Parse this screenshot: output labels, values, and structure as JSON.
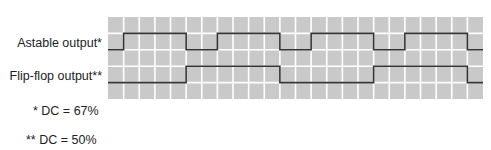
{
  "labels": {
    "astable": "Astable output*",
    "flipflop": "Flip-flop output**"
  },
  "notes": {
    "astable_dc": "* DC = 67%",
    "flipflop_dc": "** DC = 50%"
  },
  "grid": {
    "columns": 24,
    "rows": 5,
    "cell_fill": "#c9c9c9",
    "line_color": "#ffffff",
    "trace_color": "#333333"
  },
  "waveforms": {
    "astable": {
      "duty_cycle_percent": 67,
      "transitions_at_cell": [
        1,
        5,
        7,
        11,
        13,
        17,
        19,
        23
      ],
      "initial_level": "low"
    },
    "flipflop": {
      "duty_cycle_percent": 50,
      "transitions_at_cell": [
        5,
        11,
        17,
        23
      ],
      "initial_level": "low"
    }
  }
}
